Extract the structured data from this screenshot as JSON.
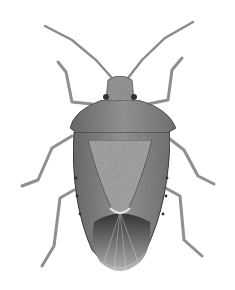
{
  "image": {
    "subject": "stink bug (shield bug) scientific illustration",
    "view": "dorsal",
    "background": "#ffffff",
    "body_color": "#8a8a8a",
    "dark_color": "#3a3a3a",
    "light_color": "#d0d0d0"
  }
}
